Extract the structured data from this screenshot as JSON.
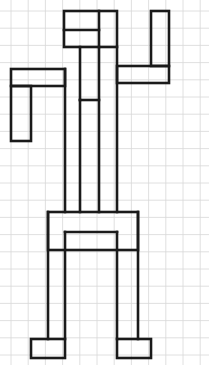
{
  "page": {
    "width": 209,
    "height": 365,
    "background_color": "#ffffff"
  },
  "grid": {
    "name": "graph-paper-grid",
    "cell_size": 17.2,
    "origin_x": 11,
    "origin_y": 11,
    "line_color": "#d8d8d8",
    "line_width": 0.8,
    "columns": 12,
    "rows": 21
  },
  "drawing": {
    "name": "human-figure-outline",
    "description": "Blocky outline drawing of a standing human figure with the right arm raised upward and the left arm bent downward at the elbow",
    "stroke_color": "#1a1a1a",
    "stroke_width": 2.6,
    "fill": "none",
    "parts": [
      {
        "name": "head",
        "type": "rect",
        "x": 64,
        "y": 11,
        "width": 53,
        "height": 36
      },
      {
        "name": "head-inner-vertical",
        "type": "line",
        "x1": 99,
        "y1": 11,
        "x2": 99,
        "y2": 47
      },
      {
        "name": "head-inner-horizontal",
        "type": "line",
        "x1": 64,
        "y1": 30,
        "x2": 99,
        "y2": 30
      },
      {
        "name": "neck-left",
        "type": "line",
        "x1": 80,
        "y1": 47,
        "x2": 80,
        "y2": 100
      },
      {
        "name": "neck-right",
        "type": "line",
        "x1": 99,
        "y1": 47,
        "x2": 99,
        "y2": 212
      },
      {
        "name": "neck-bottom",
        "type": "line",
        "x1": 80,
        "y1": 100,
        "x2": 99,
        "y2": 100
      },
      {
        "name": "torso-left",
        "type": "line",
        "x1": 65,
        "y1": 69,
        "x2": 65,
        "y2": 212
      },
      {
        "name": "torso-right",
        "type": "line",
        "x1": 117,
        "y1": 47,
        "x2": 117,
        "y2": 212
      },
      {
        "name": "torso-inner-left",
        "type": "line",
        "x1": 80,
        "y1": 100,
        "x2": 80,
        "y2": 212
      },
      {
        "name": "left-arm-upper",
        "type": "rect",
        "x": 11,
        "y": 69,
        "width": 54,
        "height": 17
      },
      {
        "name": "left-arm-forearm",
        "type": "rect",
        "x": 11,
        "y": 86,
        "width": 20,
        "height": 55
      },
      {
        "name": "right-arm-shoulder",
        "type": "rect",
        "x": 117,
        "y": 66,
        "width": 52,
        "height": 17
      },
      {
        "name": "right-arm-raised",
        "type": "rect",
        "x": 151,
        "y": 11,
        "width": 18,
        "height": 55
      },
      {
        "name": "hip-box",
        "type": "rect",
        "x": 48,
        "y": 212,
        "width": 90,
        "height": 38
      },
      {
        "name": "hip-inner-line",
        "type": "line",
        "x1": 65,
        "y1": 232,
        "x2": 117,
        "y2": 232
      },
      {
        "name": "left-leg-outer",
        "type": "line",
        "x1": 48,
        "y1": 212,
        "x2": 48,
        "y2": 339
      },
      {
        "name": "left-leg-inner",
        "type": "line",
        "x1": 65,
        "y1": 232,
        "x2": 65,
        "y2": 339
      },
      {
        "name": "right-leg-inner",
        "type": "line",
        "x1": 117,
        "y1": 232,
        "x2": 117,
        "y2": 339
      },
      {
        "name": "right-leg-outer",
        "type": "line",
        "x1": 138,
        "y1": 212,
        "x2": 138,
        "y2": 339
      },
      {
        "name": "left-foot",
        "type": "rect",
        "x": 31,
        "y": 339,
        "width": 34,
        "height": 19
      },
      {
        "name": "right-foot",
        "type": "rect",
        "x": 117,
        "y": 339,
        "width": 34,
        "height": 19
      }
    ]
  }
}
